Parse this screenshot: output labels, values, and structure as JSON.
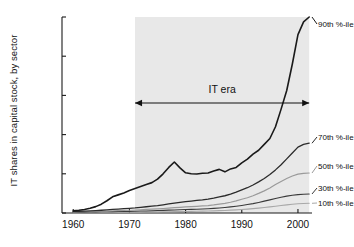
{
  "chart_data": {
    "type": "line",
    "title": "",
    "xlabel": "",
    "ylabel": "IT shares in capital stock, by sector",
    "xlim": [
      1958,
      2002.5
    ],
    "ylim": [
      0,
      0.2
    ],
    "grid": false,
    "legend_position": "right-inline",
    "xticks": [
      1960,
      1970,
      1980,
      1990,
      2000
    ],
    "xtick_labels": [
      "1960",
      "1970",
      "1980",
      "1990",
      "2000"
    ],
    "yticks": [
      0,
      0.04,
      0.08,
      0.12,
      0.16,
      0.2
    ],
    "ytick_labels": [
      "0",
      "0.04",
      "0.08",
      "0.12",
      "0.16",
      "0.2"
    ],
    "annotations": [
      {
        "name": "it-era-span",
        "text": "IT era",
        "x_start": 1971,
        "x_end": 2002,
        "y": 0.1,
        "arrow": "double"
      },
      {
        "name": "it-era-shading",
        "text": "",
        "x_start": 1971,
        "x_end": 2002,
        "color": "#e8e8e8"
      }
    ],
    "x": [
      1960,
      1961,
      1962,
      1963,
      1964,
      1965,
      1966,
      1967,
      1968,
      1969,
      1970,
      1971,
      1972,
      1973,
      1974,
      1975,
      1976,
      1977,
      1978,
      1979,
      1980,
      1981,
      1982,
      1983,
      1984,
      1985,
      1986,
      1987,
      1988,
      1989,
      1990,
      1991,
      1992,
      1993,
      1994,
      1995,
      1996,
      1997,
      1998,
      1999,
      2000,
      2001,
      2002
    ],
    "series": [
      {
        "name": "90th %-ile",
        "label": "90th %-ile",
        "color": "#1a1a1a",
        "width": 1.6,
        "values": [
          0.0022,
          0.0028,
          0.0036,
          0.0048,
          0.0065,
          0.009,
          0.0125,
          0.0165,
          0.0185,
          0.0205,
          0.023,
          0.025,
          0.027,
          0.029,
          0.031,
          0.0345,
          0.04,
          0.0465,
          0.052,
          0.046,
          0.041,
          0.04,
          0.0398,
          0.0405,
          0.0408,
          0.0428,
          0.0445,
          0.042,
          0.045,
          0.0465,
          0.0512,
          0.055,
          0.06,
          0.064,
          0.07,
          0.076,
          0.088,
          0.106,
          0.125,
          0.152,
          0.182,
          0.195,
          0.2
        ]
      },
      {
        "name": "70th %-ile",
        "label": "70th %-ile",
        "color": "#2b2b2b",
        "width": 1.3,
        "values": [
          0.0016,
          0.0018,
          0.002,
          0.0022,
          0.0025,
          0.0028,
          0.0032,
          0.0036,
          0.004,
          0.0044,
          0.0048,
          0.0052,
          0.0058,
          0.0064,
          0.007,
          0.0076,
          0.0084,
          0.0092,
          0.01,
          0.0108,
          0.0116,
          0.0122,
          0.0128,
          0.0134,
          0.0142,
          0.0152,
          0.0164,
          0.0176,
          0.0192,
          0.0212,
          0.0236,
          0.0258,
          0.0286,
          0.0318,
          0.0352,
          0.0392,
          0.044,
          0.0492,
          0.0552,
          0.0612,
          0.0672,
          0.07,
          0.0712
        ]
      },
      {
        "name": "50th %-ile",
        "label": "50th %-ile",
        "color": "#9a9a9a",
        "width": 1.2,
        "values": [
          0.0012,
          0.0013,
          0.0014,
          0.0015,
          0.0016,
          0.0018,
          0.002,
          0.0022,
          0.0024,
          0.0026,
          0.0028,
          0.003,
          0.0033,
          0.0036,
          0.0039,
          0.0042,
          0.0046,
          0.005,
          0.0054,
          0.0058,
          0.0062,
          0.0065,
          0.0068,
          0.0072,
          0.0076,
          0.0082,
          0.009,
          0.0098,
          0.011,
          0.0124,
          0.014,
          0.0156,
          0.0176,
          0.02,
          0.0226,
          0.0256,
          0.029,
          0.0322,
          0.0352,
          0.0378,
          0.0396,
          0.0404,
          0.0408
        ]
      },
      {
        "name": "30th %-ile",
        "label": "30th %-ile",
        "color": "#3a3a3a",
        "width": 1.1,
        "values": [
          0.0008,
          0.0009,
          0.0009,
          0.001,
          0.0011,
          0.0012,
          0.0013,
          0.0014,
          0.0015,
          0.0016,
          0.0017,
          0.0018,
          0.002,
          0.0021,
          0.0023,
          0.0025,
          0.0027,
          0.0029,
          0.0031,
          0.0033,
          0.0035,
          0.0037,
          0.0039,
          0.0041,
          0.0044,
          0.0047,
          0.0051,
          0.0056,
          0.0062,
          0.0069,
          0.0077,
          0.0086,
          0.0096,
          0.0108,
          0.0121,
          0.0134,
          0.0148,
          0.016,
          0.0172,
          0.0181,
          0.0188,
          0.0192,
          0.0194
        ]
      },
      {
        "name": "10th %-ile",
        "label": "10th %-ile",
        "color": "#a8a8a8",
        "width": 1.1,
        "values": [
          0.0004,
          0.0004,
          0.0005,
          0.0005,
          0.0005,
          0.0006,
          0.0006,
          0.0007,
          0.0007,
          0.0008,
          0.0008,
          0.0009,
          0.0009,
          0.001,
          0.0011,
          0.0011,
          0.0012,
          0.0013,
          0.0014,
          0.0015,
          0.0016,
          0.0017,
          0.0018,
          0.0019,
          0.002,
          0.0022,
          0.0024,
          0.0026,
          0.0029,
          0.0032,
          0.0036,
          0.004,
          0.0045,
          0.005,
          0.0056,
          0.0062,
          0.0069,
          0.0076,
          0.0083,
          0.0089,
          0.0094,
          0.0097,
          0.0099
        ]
      }
    ]
  },
  "axis_colors": {
    "axis_line": "#1a1a1a",
    "shade": "#e8e8e8",
    "text": "#111111"
  }
}
